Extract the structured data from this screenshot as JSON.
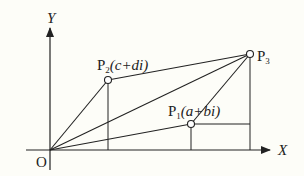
{
  "diagram": {
    "type": "complex-plane-vector-addition",
    "axes": {
      "x_label": "X",
      "y_label": "Y",
      "origin_label": "O"
    },
    "points": {
      "p1": {
        "name": "P",
        "sub": "1",
        "expr": "(a+bi)"
      },
      "p2": {
        "name": "P",
        "sub": "2",
        "expr": "(c+di)"
      },
      "p3": {
        "name": "P",
        "sub": "3",
        "expr": ""
      }
    },
    "colors": {
      "background": "#fdfdf8",
      "stroke": "#222222"
    }
  }
}
